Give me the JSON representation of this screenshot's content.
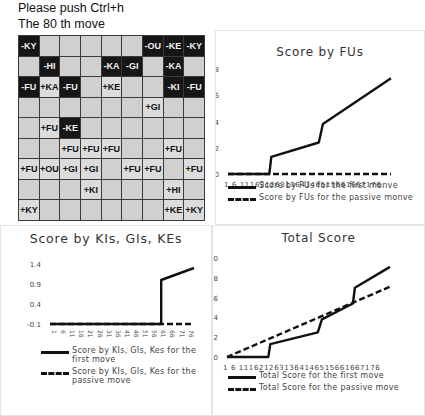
{
  "header": {
    "instruction": "Please push Ctrl+h",
    "move_label": "The   80 th move"
  },
  "board": {
    "rows": [
      [
        "-KY",
        "",
        "",
        "",
        "",
        "",
        "-OU",
        "-KE",
        "-KY"
      ],
      [
        "",
        "-HI",
        "",
        "",
        "-KA",
        "-GI",
        "",
        "-KA",
        ""
      ],
      [
        "-FU",
        "+KA",
        "-FU",
        "",
        "+KE",
        "",
        "",
        "-KI",
        "-FU"
      ],
      [
        "",
        "",
        "",
        "",
        "",
        "",
        "+GI",
        "",
        ""
      ],
      [
        "",
        "+FU",
        "-KE",
        "",
        "",
        "",
        "",
        "",
        ""
      ],
      [
        "",
        "",
        "+FU",
        "+FU",
        "+FU",
        "",
        "",
        "+FU",
        ""
      ],
      [
        "+FU",
        "+OU",
        "+GI",
        "+GI",
        "",
        "+FU",
        "+FU",
        "",
        "+FU"
      ],
      [
        "",
        "",
        "",
        "+KI",
        "",
        "",
        "",
        "+HI",
        ""
      ],
      [
        "+KY",
        "",
        "",
        "",
        "",
        "",
        "",
        "+KE",
        "+KY"
      ]
    ]
  },
  "chart_data": [
    {
      "type": "line",
      "title": "Score by FUs",
      "xlabel": "",
      "ylabel": "",
      "ylim": [
        0,
        8
      ],
      "yticks": [
        0,
        2,
        4,
        6,
        8
      ],
      "x_tick_labels": [
        "1",
        "6",
        "11",
        "16",
        "21",
        "26",
        "31",
        "36",
        "41",
        "46",
        "51",
        "56",
        "61",
        "66",
        "71",
        "76"
      ],
      "x_tick_text": "1  6 1116212631364146515661667176",
      "grid": false,
      "legend_position": "bottom",
      "series": [
        {
          "name": "Score by FUs for the first monve",
          "style": "solid",
          "points": [
            [
              1,
              0
            ],
            [
              21,
              0
            ],
            [
              22,
              1.3
            ],
            [
              45,
              2.4
            ],
            [
              47,
              3.8
            ],
            [
              80,
              7.3
            ]
          ]
        },
        {
          "name": "Score by FUs for the passive monve",
          "style": "dashed",
          "points": [
            [
              1,
              0
            ],
            [
              80,
              0
            ]
          ]
        }
      ]
    },
    {
      "type": "line",
      "title": "Score by KIs, GIs, KEs",
      "xlabel": "",
      "ylabel": "",
      "ylim": [
        -0.1,
        1.4
      ],
      "yticks": [
        -0.1,
        0.4,
        0.9,
        1.4
      ],
      "x_tick_labels": [
        "1",
        "6",
        "11",
        "16",
        "21",
        "26",
        "31",
        "36",
        "41",
        "46",
        "51",
        "56",
        "61",
        "66",
        "71",
        "76"
      ],
      "x_labels_rotated": true,
      "grid": false,
      "legend_position": "bottom",
      "series": [
        {
          "name": "Score by KIs, GIs, Kes for the first move",
          "style": "solid",
          "points": [
            [
              1,
              -0.1
            ],
            [
              62,
              -0.1
            ],
            [
              62,
              1.0
            ],
            [
              80,
              1.3
            ]
          ]
        },
        {
          "name": "Score by KIs, GIs, Kes for the passive move",
          "style": "dashed",
          "points": [
            [
              1,
              -0.1
            ],
            [
              80,
              -0.1
            ]
          ]
        }
      ]
    },
    {
      "type": "line",
      "title": "Total Score",
      "xlabel": "",
      "ylabel": "",
      "ylim": [
        0,
        10
      ],
      "yticks": [
        0,
        2,
        4,
        6,
        8,
        10
      ],
      "x_tick_labels": [
        "1",
        "6",
        "11",
        "16",
        "21",
        "26",
        "31",
        "36",
        "41",
        "46",
        "51",
        "56",
        "61",
        "66",
        "71",
        "76"
      ],
      "x_tick_text": "1  6 1116212631364146515661667176",
      "grid": false,
      "legend_position": "bottom",
      "series": [
        {
          "name": "Total Score for the first move",
          "style": "solid",
          "points": [
            [
              1,
              0
            ],
            [
              21,
              0
            ],
            [
              22,
              1.3
            ],
            [
              45,
              2.5
            ],
            [
              47,
              3.8
            ],
            [
              62,
              5.4
            ],
            [
              63,
              7.0
            ],
            [
              80,
              9.1
            ]
          ]
        },
        {
          "name": "Total Score for the passive move",
          "style": "dashed",
          "points": [
            [
              1,
              0
            ],
            [
              80,
              7.1
            ]
          ]
        }
      ]
    }
  ],
  "legends": {
    "fu_first": "Score by FUs for the first monve",
    "fu_passive": "Score by FUs for the passive monve",
    "kgk_first": "Score by KIs, GIs, Kes for the first move",
    "kgk_passive": "Score by KIs, GIs, Kes for the passive move",
    "total_first": "Total Score for the first move",
    "total_passive": "Total Score for the passive move"
  },
  "titles": {
    "fu": "Score by FUs",
    "kgk": "Score by KIs, GIs, KEs",
    "total": "Total Score"
  }
}
